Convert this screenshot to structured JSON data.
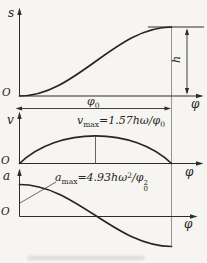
{
  "colors": {
    "ink": "#2e2d2b",
    "background": "#f6f5f2",
    "reference_line": "#8b8b86"
  },
  "panels": {
    "displacement": {
      "y_axis_label": "s",
      "origin_label": "O",
      "x_axis_label": "φ",
      "rise_angle_label": {
        "base": "φ",
        "sub": "0"
      },
      "height_label": "h",
      "curve": "harmonic (cosine) rise from 0 to h over cam angle φ0, levels off at top"
    },
    "velocity": {
      "y_axis_label": "v",
      "origin_label": "O",
      "x_axis_label": "φ",
      "peak_label": {
        "var": "v",
        "var_sub": "max",
        "value": "=1.57",
        "expr": "hω/φ",
        "expr_sub": "0"
      },
      "curve": "half-sine arch, zero at both ends, maximum at midpoint with vertical drop line"
    },
    "acceleration": {
      "y_axis_label": "a",
      "origin_label": "O",
      "x_axis_label": "φ",
      "peak_label": {
        "var": "a",
        "var_sub": "max",
        "value": "=4.93",
        "expr": "hω",
        "expr_sup": "2",
        "slash": "/φ",
        "denom_sup": "2",
        "denom_sub": "0"
      },
      "curve": "cosine wave starting at +amax at φ=0, through zero at midpoint, to −amax at φ0"
    }
  }
}
